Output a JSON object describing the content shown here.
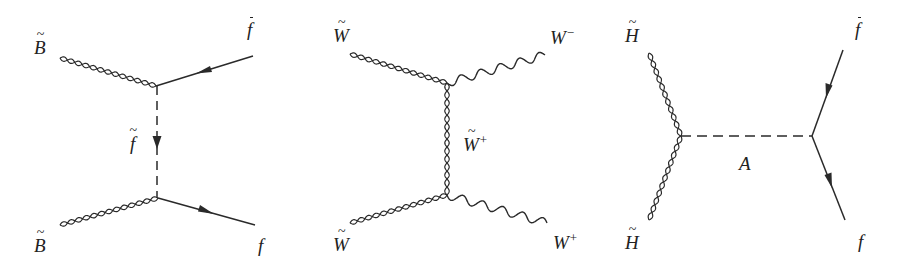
{
  "diagrams": [
    {
      "id": "bino-annihilation",
      "labels": {
        "top_left": {
          "base": "B",
          "decoration": "tilde",
          "sup": ""
        },
        "top_right": {
          "base": "f",
          "decoration": "bar",
          "sup": ""
        },
        "propagator": {
          "base": "f",
          "decoration": "tilde",
          "sup": ""
        },
        "bottom_left": {
          "base": "B",
          "decoration": "tilde",
          "sup": ""
        },
        "bottom_right": {
          "base": "f",
          "decoration": "",
          "sup": ""
        }
      },
      "lines": {
        "top_left": "double-wavy",
        "bottom_left": "double-wavy",
        "top_right": "fermion-arrow-in",
        "bottom_right": "fermion-arrow-out",
        "propagator": "dashed-arrow-down"
      }
    },
    {
      "id": "wino-annihilation",
      "labels": {
        "top_left": {
          "base": "W",
          "decoration": "tilde",
          "sup": ""
        },
        "top_right": {
          "base": "W",
          "decoration": "",
          "sup": "−"
        },
        "propagator": {
          "base": "W",
          "decoration": "tilde",
          "sup": "+"
        },
        "bottom_left": {
          "base": "W",
          "decoration": "tilde",
          "sup": ""
        },
        "bottom_right": {
          "base": "W",
          "decoration": "",
          "sup": "+"
        }
      },
      "lines": {
        "top_left": "double-wavy",
        "bottom_left": "double-wavy",
        "top_right": "wavy",
        "bottom_right": "wavy",
        "propagator": "double-wavy"
      }
    },
    {
      "id": "higgsino-annihilation",
      "labels": {
        "top_left": {
          "base": "H",
          "decoration": "tilde",
          "sup": ""
        },
        "bottom_left": {
          "base": "H",
          "decoration": "tilde",
          "sup": ""
        },
        "propagator": {
          "base": "A",
          "decoration": "",
          "sup": ""
        },
        "top_right": {
          "base": "f",
          "decoration": "bar",
          "sup": ""
        },
        "bottom_right": {
          "base": "f",
          "decoration": "",
          "sup": ""
        }
      },
      "lines": {
        "top_left": "double-wavy",
        "bottom_left": "double-wavy",
        "propagator": "dashed",
        "top_right": "fermion-arrow-in",
        "bottom_right": "fermion-arrow-out"
      }
    }
  ],
  "colors": {
    "line": "#2a2a2a",
    "background": "#ffffff"
  }
}
